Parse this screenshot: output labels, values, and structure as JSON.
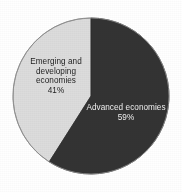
{
  "chart_data": {
    "type": "pie",
    "title": "",
    "subtitle": "",
    "xlabel": "",
    "ylabel": "",
    "legend_position": "none",
    "grid": false,
    "labels_inside_slices": true,
    "categories": [
      "Advanced economies",
      "Emerging and developing economies"
    ],
    "values": [
      59,
      41
    ],
    "unit": "%",
    "start_angle_deg": 0,
    "direction": "clockwise",
    "slices": [
      {
        "name": "Advanced economies",
        "value": 59,
        "value_label": "59%",
        "color": "#333333",
        "text_color": "#f0f0f0",
        "label_lines": [
          "Advanced economies",
          "59%"
        ]
      },
      {
        "name": "Emerging and developing economies",
        "value": 41,
        "value_label": "41%",
        "color": "#dcdcdc",
        "text_color": "#1e1e1e",
        "label_lines": [
          "Emerging and",
          "developing",
          "economies",
          "41%"
        ]
      }
    ]
  },
  "figure": {
    "background_color": "#ffffff",
    "outline_color": "#8c8c8c",
    "center_x": 91,
    "center_y": 96,
    "radius": 78
  },
  "labels": {
    "emerging": "Emerging and\ndeveloping\neconomies\n41%",
    "advanced": "Advanced economies\n59%"
  }
}
